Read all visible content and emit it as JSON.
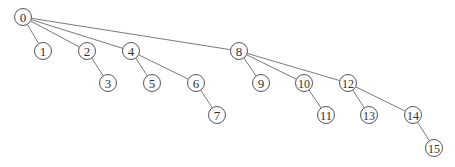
{
  "diagram": {
    "type": "tree",
    "colors": {
      "background": "#ffffff",
      "edge": "#6a6a6a",
      "node_stroke": "#555555",
      "text": "#333333"
    },
    "node_radius": 8.5,
    "nodes": [
      {
        "id": "0",
        "label": "0",
        "x": 23,
        "y": 17
      },
      {
        "id": "1",
        "label": "1",
        "x": 43,
        "y": 51
      },
      {
        "id": "2",
        "label": "2",
        "x": 87,
        "y": 51
      },
      {
        "id": "3",
        "label": "3",
        "x": 108,
        "y": 83
      },
      {
        "id": "4",
        "label": "4",
        "x": 131,
        "y": 51
      },
      {
        "id": "5",
        "label": "5",
        "x": 152,
        "y": 83
      },
      {
        "id": "6",
        "label": "6",
        "x": 196,
        "y": 83
      },
      {
        "id": "7",
        "label": "7",
        "x": 217,
        "y": 115
      },
      {
        "id": "8",
        "label": "8",
        "x": 239,
        "y": 51
      },
      {
        "id": "9",
        "label": "9",
        "x": 261,
        "y": 83
      },
      {
        "id": "10",
        "label": "10",
        "x": 304,
        "y": 83
      },
      {
        "id": "11",
        "label": "11",
        "x": 326,
        "y": 115
      },
      {
        "id": "12",
        "label": "12",
        "x": 348,
        "y": 83
      },
      {
        "id": "13",
        "label": "13",
        "x": 369,
        "y": 115
      },
      {
        "id": "14",
        "label": "14",
        "x": 413,
        "y": 115
      },
      {
        "id": "15",
        "label": "15",
        "x": 434,
        "y": 148
      }
    ],
    "edges": [
      {
        "from": "0",
        "to": "1"
      },
      {
        "from": "0",
        "to": "2"
      },
      {
        "from": "0",
        "to": "4"
      },
      {
        "from": "0",
        "to": "8"
      },
      {
        "from": "2",
        "to": "3"
      },
      {
        "from": "4",
        "to": "5"
      },
      {
        "from": "4",
        "to": "6"
      },
      {
        "from": "6",
        "to": "7"
      },
      {
        "from": "8",
        "to": "9"
      },
      {
        "from": "8",
        "to": "10"
      },
      {
        "from": "8",
        "to": "12"
      },
      {
        "from": "10",
        "to": "11"
      },
      {
        "from": "12",
        "to": "13"
      },
      {
        "from": "12",
        "to": "14"
      },
      {
        "from": "14",
        "to": "15"
      }
    ]
  }
}
